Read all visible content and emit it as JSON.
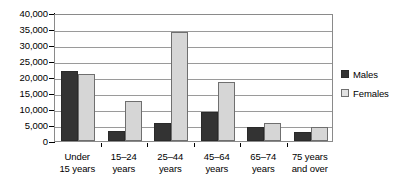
{
  "chart_data": {
    "type": "bar",
    "title": "",
    "subtitle": "",
    "xlabel": "",
    "ylabel": "",
    "categories": [
      "Under\n15 years",
      "15–24\nyears",
      "25–44\nyears",
      "45–64\nyears",
      "65–74\nyears",
      "75 years\nand over"
    ],
    "category_lines": [
      [
        "Under",
        "15 years"
      ],
      [
        "15–24",
        "years"
      ],
      [
        "25–44",
        "years"
      ],
      [
        "45–64",
        "years"
      ],
      [
        "65–74",
        "years"
      ],
      [
        "75 years",
        "and over"
      ]
    ],
    "series": [
      {
        "name": "Males",
        "color": "#333333",
        "values": [
          22000,
          3000,
          5500,
          9000,
          4500,
          2800
        ]
      },
      {
        "name": "Females",
        "color": "#d6d6d6",
        "values": [
          21000,
          12500,
          34000,
          18500,
          5500,
          4500
        ]
      }
    ],
    "ylim": [
      0,
      40000
    ],
    "ytick_values": [
      0,
      5000,
      10000,
      15000,
      20000,
      25000,
      30000,
      35000,
      40000
    ],
    "ytick_labels": [
      "0",
      "5,000",
      "10,000",
      "15,000",
      "20,000",
      "25,000",
      "30,000",
      "35,000",
      "40,000"
    ],
    "grid": true,
    "grid_axis": "y",
    "legend": {
      "position": "right",
      "entries": [
        {
          "label": "Males",
          "color": "#333333"
        },
        {
          "label": "Females",
          "color": "#e2e2e2"
        }
      ]
    }
  }
}
